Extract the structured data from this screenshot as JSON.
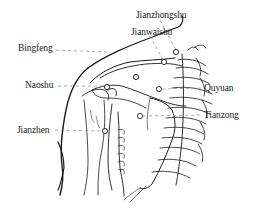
{
  "diagram": {
    "points": [
      {
        "id": "jianzhongshu",
        "label": "Jianzhongshu",
        "x": 176,
        "y": 52,
        "label_x": 136,
        "label_y": 11
      },
      {
        "id": "jianwaishu",
        "label": "Jianwaishu",
        "x": 164,
        "y": 62,
        "label_x": 131,
        "label_y": 28
      },
      {
        "id": "bingfeng",
        "label": "Bingfeng",
        "x": 136,
        "y": 77,
        "label_x": 18,
        "label_y": 42
      },
      {
        "id": "naoshu",
        "label": "Naoshu",
        "x": 107,
        "y": 87,
        "label_x": 25,
        "label_y": 80
      },
      {
        "id": "quyuan",
        "label": "Quyuan",
        "x": 159,
        "y": 89,
        "label_x": 204,
        "label_y": 84
      },
      {
        "id": "tianzong",
        "label": "Tianzong",
        "x": 140,
        "y": 116,
        "label_x": 204,
        "label_y": 111
      },
      {
        "id": "jianzhen",
        "label": "Jianzhen",
        "x": 105,
        "y": 131,
        "label_x": 17,
        "label_y": 126
      }
    ],
    "colors": {
      "line": "#1a1a1a",
      "leader": "#888888",
      "background": "#ffffff"
    }
  }
}
